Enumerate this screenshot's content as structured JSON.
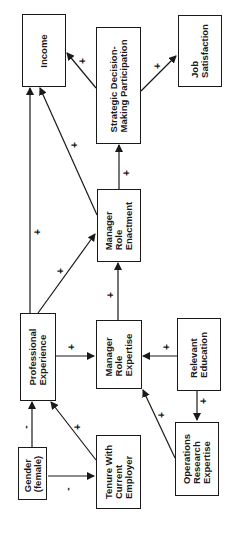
{
  "diagram": {
    "orientation": "rotated-90-ccw",
    "nodes": {
      "income": {
        "label": "Income"
      },
      "strategic": {
        "label": "Strategic Decision-\nMaking Participation"
      },
      "job_satisfaction": {
        "label": "Job\nSatisfaction"
      },
      "role_enactment": {
        "label": "Manager\nRole\nEnactment"
      },
      "professional_experience": {
        "label": "Professional\nExperience"
      },
      "role_expertise": {
        "label": "Manager\nRole\nExpertise"
      },
      "relevant_education": {
        "label": "Relevant\nEducation"
      },
      "gender": {
        "label": "Gender\n(female)"
      },
      "tenure": {
        "label": "Tenure With\nCurrent\nEmployer"
      },
      "or_expertise": {
        "label": "Operations\nResearch\nExpertise"
      }
    },
    "edges": [
      {
        "from": "strategic",
        "to": "income",
        "sign": "+"
      },
      {
        "from": "strategic",
        "to": "job_satisfaction",
        "sign": "+"
      },
      {
        "from": "professional_experience",
        "to": "income",
        "sign": "+"
      },
      {
        "from": "role_enactment",
        "to": "income",
        "sign": "+"
      },
      {
        "from": "role_enactment",
        "to": "strategic",
        "sign": "+"
      },
      {
        "from": "professional_experience",
        "to": "role_enactment",
        "sign": "+"
      },
      {
        "from": "role_expertise",
        "to": "role_enactment",
        "sign": "+"
      },
      {
        "from": "professional_experience",
        "to": "role_expertise",
        "sign": "+"
      },
      {
        "from": "relevant_education",
        "to": "role_expertise",
        "sign": "+"
      },
      {
        "from": "relevant_education",
        "to": "or_expertise",
        "sign": "+"
      },
      {
        "from": "or_expertise",
        "to": "role_expertise",
        "sign": "+"
      },
      {
        "from": "gender",
        "to": "professional_experience",
        "sign": "-"
      },
      {
        "from": "tenure",
        "to": "professional_experience",
        "sign": "+"
      },
      {
        "from": "gender",
        "to": "tenure",
        "sign": "-"
      }
    ],
    "signs": {
      "plus": "+",
      "minus": "-"
    }
  }
}
